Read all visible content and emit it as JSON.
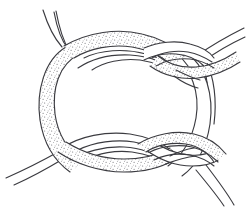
{
  "figure": {
    "title": "Interwoven two-strand knot diagram",
    "background_color": "#ffffff",
    "ink_color": "#3b3b40",
    "stipple_color": "#5a5a5f",
    "canvas": {
      "width": 246,
      "height": 208
    },
    "strands": [
      {
        "id": "strand-shaded",
        "label": "Stippled band",
        "texture": "stipple",
        "fill_color": "#ffffff",
        "stipple_color": "#5a5a5f"
      },
      {
        "id": "strand-plain",
        "label": "Plain band",
        "texture": "none",
        "fill_color": "#ffffff",
        "stipple_color": "#ffffff"
      }
    ],
    "crossings": [
      {
        "id": "crossing-top-left",
        "label": "Top left crossing",
        "over": "strand-shaded"
      },
      {
        "id": "crossing-top-right",
        "label": "Top right crossing",
        "over": "strand-plain"
      },
      {
        "id": "crossing-bottom-left",
        "label": "Bottom left crossing",
        "over": "strand-plain"
      },
      {
        "id": "crossing-bottom-right",
        "label": "Bottom right crossing",
        "over": "strand-shaded"
      }
    ],
    "free_ends": [
      {
        "id": "end-top-left-a",
        "label": "Upper left free end A"
      },
      {
        "id": "end-top-left-b",
        "label": "Upper left free end B"
      },
      {
        "id": "end-top-right",
        "label": "Upper right free end"
      },
      {
        "id": "end-bottom-left",
        "label": "Lower left free end"
      },
      {
        "id": "end-bottom-right",
        "label": "Lower right free end"
      }
    ]
  }
}
